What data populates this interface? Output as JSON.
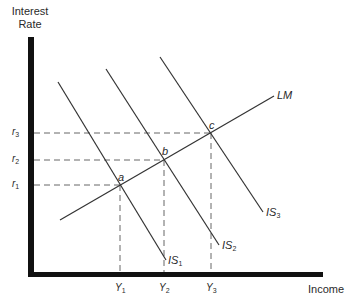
{
  "diagram": {
    "type": "IS-LM diagram",
    "y_axis_title_line1": "Interest",
    "y_axis_title_line2": "Rate",
    "x_axis_title": "Income",
    "y_ticks": [
      {
        "base": "r",
        "sub": "3",
        "y": 133
      },
      {
        "base": "r",
        "sub": "2",
        "y": 160
      },
      {
        "base": "r",
        "sub": "1",
        "y": 185
      }
    ],
    "x_ticks": [
      {
        "base": "Y",
        "sub": "1",
        "x": 120
      },
      {
        "base": "Y",
        "sub": "2",
        "x": 164
      },
      {
        "base": "Y",
        "sub": "3",
        "x": 211
      }
    ],
    "points": [
      {
        "label": "a",
        "x": 120,
        "y": 185
      },
      {
        "label": "b",
        "x": 164,
        "y": 160
      },
      {
        "label": "c",
        "x": 211,
        "y": 133
      }
    ],
    "curves": [
      {
        "name": "LM",
        "base": "LM",
        "sub": "",
        "x1": 60,
        "y1": 220,
        "x2": 274,
        "y2": 96
      },
      {
        "name": "IS1",
        "base": "IS",
        "sub": "1",
        "x1": 58,
        "y1": 82,
        "x2": 166,
        "y2": 260
      },
      {
        "name": "IS2",
        "base": "IS",
        "sub": "2",
        "x1": 106,
        "y1": 69,
        "x2": 219,
        "y2": 245
      },
      {
        "name": "IS3",
        "base": "IS",
        "sub": "3",
        "x1": 160,
        "y1": 57,
        "x2": 263,
        "y2": 212
      }
    ],
    "colors": {
      "axis": "#111111",
      "line": "#333333",
      "guide": "#555555",
      "text": "#2a2a2a"
    }
  }
}
